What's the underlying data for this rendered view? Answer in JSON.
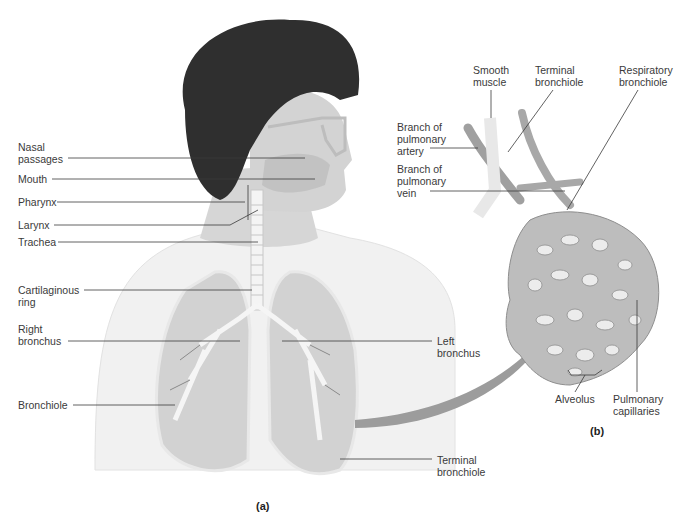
{
  "figure": {
    "panel_a": {
      "label": "(a)",
      "labels": [
        {
          "id": "nasal-passages",
          "text": "Nasal\npassages"
        },
        {
          "id": "mouth",
          "text": "Mouth"
        },
        {
          "id": "pharynx",
          "text": "Pharynx"
        },
        {
          "id": "larynx",
          "text": "Larynx"
        },
        {
          "id": "trachea",
          "text": "Trachea"
        },
        {
          "id": "cartilaginous-ring",
          "text": "Cartilaginous\nring"
        },
        {
          "id": "right-bronchus",
          "text": "Right\nbronchus"
        },
        {
          "id": "bronchiole",
          "text": "Bronchiole"
        },
        {
          "id": "left-bronchus",
          "text": "Left\nbronchus"
        },
        {
          "id": "terminal-bronchiole-a",
          "text": "Terminal\nbronchiole"
        }
      ]
    },
    "panel_b": {
      "label": "(b)",
      "labels": [
        {
          "id": "smooth-muscle",
          "text": "Smooth\nmuscle"
        },
        {
          "id": "terminal-bronchiole-b",
          "text": "Terminal\nbronchiole"
        },
        {
          "id": "respiratory-bronchiole",
          "text": "Respiratory\nbronchiole"
        },
        {
          "id": "branch-pulmonary-artery",
          "text": "Branch of\npulmonary\nartery"
        },
        {
          "id": "branch-pulmonary-vein",
          "text": "Branch of\npulmonary\nvein"
        },
        {
          "id": "alveolus",
          "text": "Alveolus"
        },
        {
          "id": "pulmonary-capillaries",
          "text": "Pulmonary\ncapillaries"
        }
      ]
    },
    "colors": {
      "hair": "#2e2e2e",
      "skin": "#d9d9d9",
      "body": "#eeeeee",
      "lung": "#d4d4d4",
      "arrow": "#9a9a9a",
      "leader": "#3a3a3a"
    }
  }
}
